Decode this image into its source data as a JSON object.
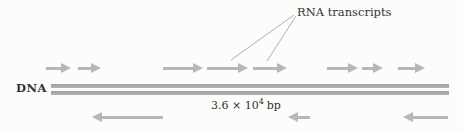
{
  "figure": {
    "rna_label": "RNA transcripts",
    "dna_label": "DNA",
    "length": {
      "base": "3.6 × 10",
      "exponent": "4",
      "unit": "bp"
    },
    "colors": {
      "arrow": "#b6b7b9",
      "dna_strand": "#a9aaac",
      "text": "#333333",
      "leader_line": "#9b9b9b",
      "background": "#fcfcfb"
    },
    "top_arrows": [
      {
        "dir": "right",
        "x": 46,
        "w": 25
      },
      {
        "dir": "right",
        "x": 78,
        "w": 23
      },
      {
        "dir": "right",
        "x": 163,
        "w": 40
      },
      {
        "dir": "right",
        "x": 207,
        "w": 41
      },
      {
        "dir": "right",
        "x": 253,
        "w": 34
      },
      {
        "dir": "right",
        "x": 327,
        "w": 31
      },
      {
        "dir": "right",
        "x": 362,
        "w": 21
      },
      {
        "dir": "right",
        "x": 398,
        "w": 27
      }
    ],
    "bottom_arrows": [
      {
        "dir": "left",
        "x": 92,
        "w": 71
      },
      {
        "dir": "left",
        "x": 288,
        "w": 22
      },
      {
        "dir": "left",
        "x": 403,
        "w": 45
      }
    ]
  }
}
